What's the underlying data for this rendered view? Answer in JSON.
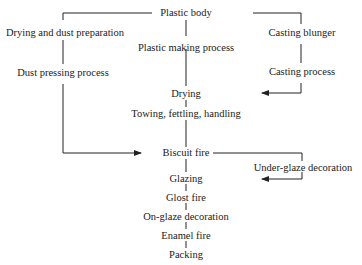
{
  "diagram": {
    "nodes": {
      "plastic_body": "Plastic body",
      "drying_dust_prep": "Drying and dust preparation",
      "plastic_making": "Plastic making process",
      "casting_blunger": "Casting blunger",
      "dust_pressing": "Dust pressing process",
      "casting_process": "Casting process",
      "drying": "Drying",
      "towing": "Towing, fettling, handling",
      "biscuit_fire": "Biscuit fire",
      "under_glaze": "Under-glaze decoration",
      "glazing": "Glazing",
      "glost_fire": "Glost fire",
      "on_glaze": "On-glaze decoration",
      "enamel_fire": "Enamel fire",
      "packing": "Packing"
    },
    "colors": {
      "line": "#222222",
      "text": "#222222"
    }
  }
}
